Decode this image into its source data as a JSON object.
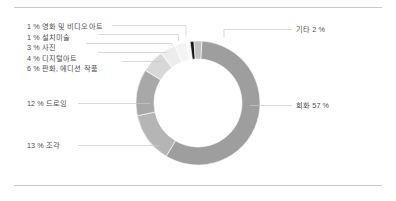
{
  "chart_data": {
    "type": "pie",
    "variant": "donut",
    "title": "",
    "subtitle": "",
    "xlabel": "",
    "ylabel": "",
    "legend_position": "callout-labels",
    "grid": false,
    "total_label": "",
    "categories": [
      "회화",
      "조각",
      "드로잉",
      "판화, 에디션 작품",
      "디지털아트",
      "사진",
      "설치미술",
      "영화 및 비디오아트",
      "기타"
    ],
    "values": [
      57,
      13,
      12,
      6,
      4,
      3,
      1,
      1,
      2
    ],
    "value_suffix": "%",
    "slice_colors": [
      "#9e9e9e",
      "#b5b5b5",
      "#a8a8a8",
      "#d8d8d8",
      "#ededed",
      "#f4f4f4",
      "#fafafa",
      "#1a1a1a",
      "#c2c2c2"
    ],
    "labels": [
      {
        "key": "film_video",
        "text": "1 % 영화 및 비디오아트",
        "side": "left-stack"
      },
      {
        "key": "installation",
        "text": "1 % 설치미술",
        "side": "left-stack"
      },
      {
        "key": "photography",
        "text": "3 % 사진",
        "side": "left-stack"
      },
      {
        "key": "digital_art",
        "text": "4 % 디지털아트",
        "side": "left-stack"
      },
      {
        "key": "print_edition",
        "text": "6 % 판화, 에디션 작품",
        "side": "left-stack"
      },
      {
        "key": "drawing",
        "text": "12 % 드로잉",
        "side": "left"
      },
      {
        "key": "sculpture",
        "text": "13 % 조각",
        "side": "left"
      },
      {
        "key": "other",
        "text": "기타 2 %",
        "side": "right"
      },
      {
        "key": "painting",
        "text": "회화 57 %",
        "side": "right"
      }
    ]
  },
  "colors": {
    "rule": "#c9c9c9",
    "leader": "#c9c9c9",
    "text": "#4d4d4d",
    "background": "#ffffff"
  }
}
